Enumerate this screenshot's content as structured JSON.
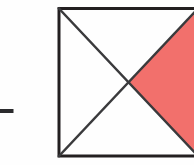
{
  "figure": {
    "title": "Square with both diagonals, one quarter triangle shaded",
    "canvas": {
      "width": 194,
      "height": 165,
      "background": "#fefefe"
    },
    "colors": {
      "shaded_fill": "#f2706c",
      "shaded_fill_light": "#f6817d",
      "outline": "#231f20",
      "diagonal": "#3a3a3c",
      "background": "#fefefe",
      "dash_mark": "#2b2b2d"
    },
    "stroke_widths": {
      "square_outline": 3.0,
      "diagonal": 2.4,
      "dash_mark": 4.0
    },
    "square": {
      "label": "square-outline",
      "left": 59,
      "top": 8.5,
      "right": 198,
      "bottom": 156,
      "note": "right edge extends beyond the right image border (cropped)"
    },
    "center_point": {
      "x": 128.5,
      "y": 82.5,
      "label": "diagonal-intersection"
    },
    "corners": {
      "top_left": {
        "x": 59,
        "y": 8.5
      },
      "top_right": {
        "x": 198,
        "y": 8.5
      },
      "bottom_right": {
        "x": 198,
        "y": 156
      },
      "bottom_left": {
        "x": 59,
        "y": 156
      }
    },
    "diagonals": [
      {
        "name": "diagonal-top-left-to-bottom-right",
        "from": {
          "x": 59,
          "y": 8.5
        },
        "to": {
          "x": 198,
          "y": 156
        }
      },
      {
        "name": "diagonal-bottom-left-to-top-right",
        "from": {
          "x": 59,
          "y": 156
        },
        "to": {
          "x": 198,
          "y": 8.5
        }
      }
    ],
    "shaded_region": {
      "name": "shaded-right-triangle",
      "description": "right quarter triangle formed by the two diagonals and the right side of the square",
      "points": "128.5,82.5 198,8.5 198,156",
      "fraction_of_square": "1/4",
      "fill": "#f2706c"
    },
    "dash_mark": {
      "name": "left-dash-mark",
      "x1": 0,
      "y1": 111,
      "x2": 13.5,
      "y2": 111,
      "color": "#2b2b2d"
    }
  }
}
